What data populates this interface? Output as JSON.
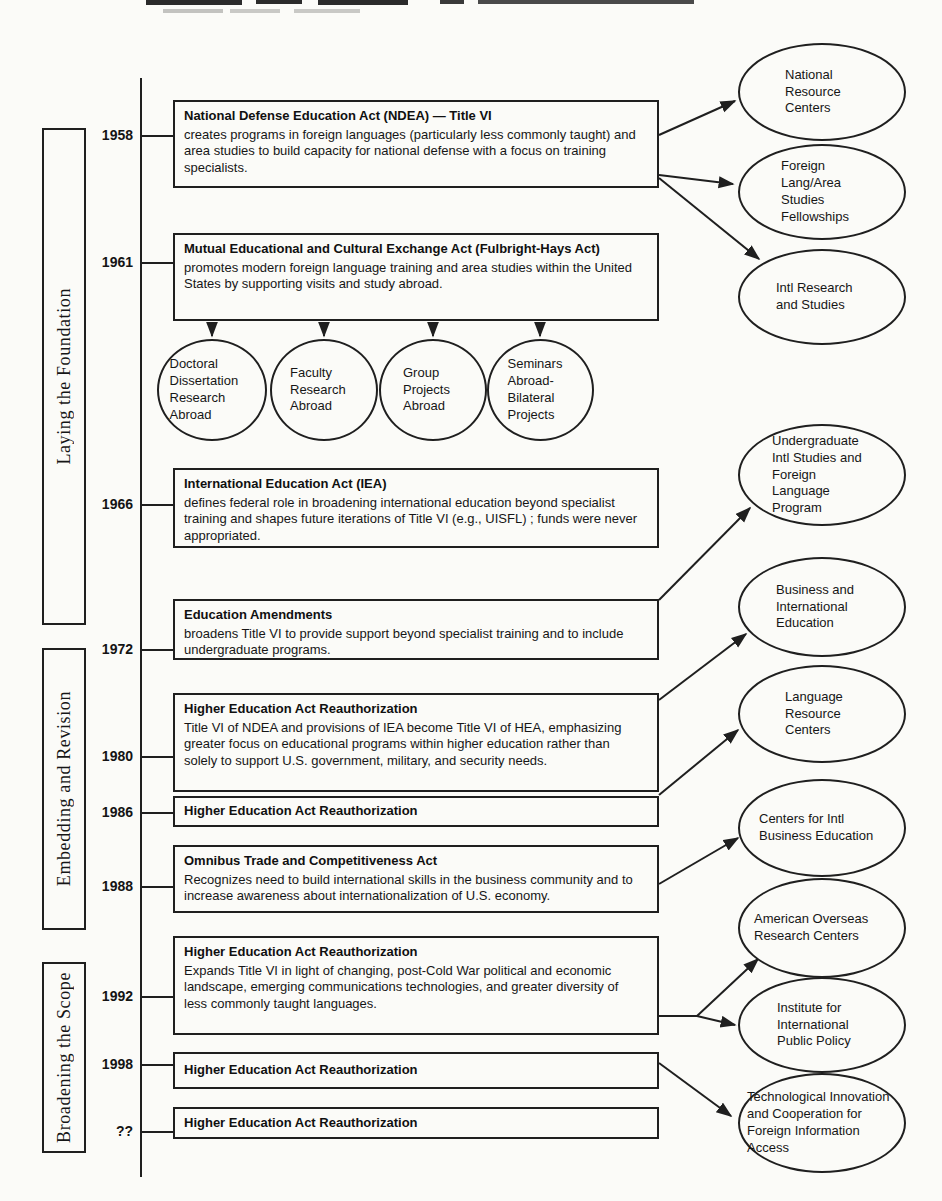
{
  "page": {
    "background": "#fbfbf8",
    "ink": "#1f1f1f"
  },
  "eras": [
    {
      "label": "Laying the Foundation"
    },
    {
      "label": "Embedding and Revision"
    },
    {
      "label": "Broadening the Scope"
    }
  ],
  "acts": [
    {
      "year": "1958",
      "title": "National Defense Education Act (NDEA)  — Title VI",
      "description": "creates programs in foreign languages (particularly less commonly taught) and area studies to build capacity for national defense with a focus on training specialists."
    },
    {
      "year": "1961",
      "title": "Mutual Educational and Cultural Exchange Act (Fulbright-Hays Act)",
      "description": "promotes modern foreign language training and area studies within the United States by supporting visits and study abroad."
    },
    {
      "year": "1966",
      "title": "International Education Act (IEA)",
      "description": "defines federal role in broadening international education beyond specialist training and shapes future iterations of Title VI (e.g., UISFL) ; funds were never appropriated."
    },
    {
      "year": "1972",
      "title": "Education Amendments",
      "description": "broadens Title VI to provide support beyond specialist training and to include undergraduate programs."
    },
    {
      "year": "1980",
      "title": "Higher Education Act Reauthorization",
      "description": "Title VI of NDEA and provisions of IEA become Title VI of HEA, emphasizing greater focus on educational programs within higher education rather than solely to support U.S. government, military, and security needs."
    },
    {
      "year": "1986",
      "title": "Higher Education Act Reauthorization",
      "description": ""
    },
    {
      "year": "1988",
      "title": "Omnibus Trade and Competitiveness Act",
      "description": "Recognizes need to build international skills in the business community and to increase awareness about internationalization of U.S. economy."
    },
    {
      "year": "1992",
      "title": "Higher Education Act Reauthorization",
      "description": "Expands Title VI in light of changing, post-Cold War political and economic landscape, emerging communications technologies, and greater diversity of less commonly taught languages."
    },
    {
      "year": "1998",
      "title": "Higher Education Act Reauthorization",
      "description": ""
    },
    {
      "year": "??",
      "title": "Higher Education Act Reauthorization",
      "description": ""
    }
  ],
  "fulbright_programs": [
    "Doctoral Dissertation Research Abroad",
    "Faculty Research Abroad",
    "Group Projects Abroad",
    "Seminars Abroad- Bilateral Projects"
  ],
  "programs": [
    "National Resource Centers",
    "Foreign Lang/Area Studies Fellowships",
    "Intl Research and Studies",
    "Undergraduate Intl Studies and Foreign Language Program",
    "Business and International Education",
    "Language Resource Centers",
    "Centers for Intl Business Education",
    "American Overseas Research Centers",
    "Institute for International Public Policy",
    "Technological Innovation and Cooperation for Foreign Information Access"
  ]
}
